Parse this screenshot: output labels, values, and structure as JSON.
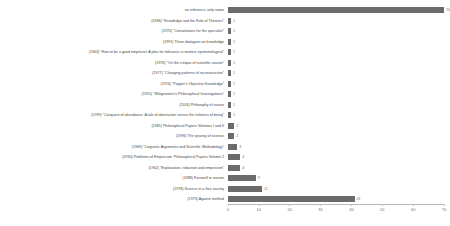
{
  "chart_data": {
    "type": "bar",
    "orientation": "horizontal",
    "title": "",
    "xlabel": "",
    "ylabel": "",
    "xlim": [
      0,
      70
    ],
    "xticks": [
      0,
      10,
      20,
      30,
      40,
      50,
      60,
      70
    ],
    "grid": false,
    "legend": false,
    "bar_color": "#6b6b6b",
    "categories": [
      "no reference, only name",
      "(1986) \"Knowledge and the Role of Theories\"",
      "(1970) \"Consolations for the specialist\"",
      "(1991) Three dialogues on knowledge",
      "(1963) \"How to be a good empiricist: A plea for tolerance in matters epistemological\"",
      "(1976) \"On the critique of scientific reason\"",
      "(1977) \"Changing patterns of reconstruction\"",
      "(1974) \"Popper's Objective Knowledge\"",
      "(1955) \"Wittgenstein's Philosophical Investigations\"",
      "(2016) Philosophy of nature",
      "(1999) \"Conquest of abundance: A tale of abstraction versus the richness of being\"",
      "(1981) Philosophical Papers Volumes I and II",
      "(1996) The tyranny of science",
      "(1969) \"Linguistic Arguments and Scientific Methodology\"",
      "(1990) Problems of Empiricism: Philosophical Papers Volume 2",
      "(1962) \"Explanation, reduction and empiricism\"",
      "(1988) Farewell to reason",
      "(1978) Science in a free society",
      "(1975) Against method"
    ],
    "values": [
      70,
      1,
      1,
      1,
      1,
      1,
      1,
      1,
      1,
      1,
      1,
      2,
      2,
      3,
      4,
      4,
      9,
      11,
      41
    ],
    "value_labels": [
      "70",
      "1",
      "1",
      "1",
      "1",
      "1",
      "1",
      "1",
      "1",
      "1",
      "1",
      "2",
      "2",
      "3",
      "4",
      "4",
      "9",
      "11",
      "41"
    ]
  }
}
